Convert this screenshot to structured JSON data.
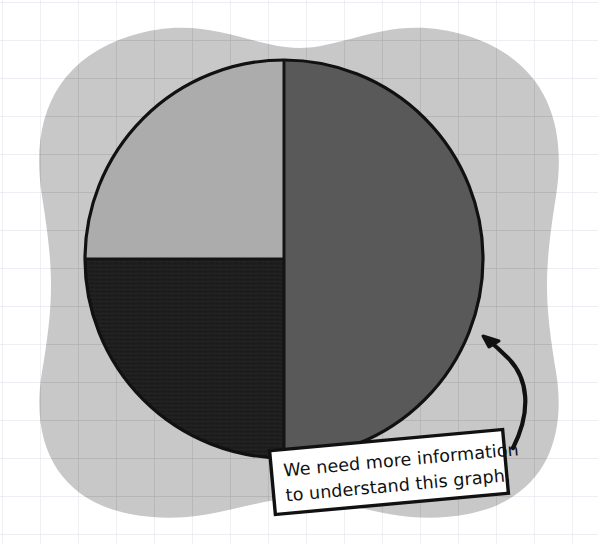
{
  "canvas": {
    "width": 598,
    "height": 544,
    "background_color": "#ffffff"
  },
  "background": {
    "name": "grid-paper",
    "grid_color": "#e7e7ef",
    "grid_spacing": 38,
    "blob_color": "#c8c8c8",
    "blob_grid_color": "#9a9a9a"
  },
  "chart_data": {
    "type": "pie",
    "title": "",
    "subtitle": "",
    "xlabel": "",
    "ylabel": "",
    "legend_position": "none",
    "grid": false,
    "labels": [
      "Right half",
      "Upper left quadrant",
      "Lower left quadrant"
    ],
    "values": [
      50,
      25,
      25
    ],
    "units": "percent",
    "total": 100,
    "start_angle_deg": 0,
    "direction": "clockwise",
    "center": {
      "x": 284,
      "y": 259
    },
    "radius": 199,
    "outline_color": "#111111",
    "outline_width": 3,
    "slices": [
      {
        "label": "Right half",
        "value": 50,
        "percent": "50%",
        "color": "#595959",
        "start_angle_deg": 0,
        "end_angle_deg": 180
      },
      {
        "label": "Lower left quadrant",
        "value": 25,
        "percent": "25%",
        "color": "#1e1e1e",
        "start_angle_deg": 180,
        "end_angle_deg": 270
      },
      {
        "label": "Upper left quadrant",
        "value": 25,
        "percent": "25%",
        "color": "#acacac",
        "start_angle_deg": 270,
        "end_angle_deg": 360
      }
    ],
    "annotations": [
      {
        "name": "callout",
        "line1": "We need more information",
        "line2": "to understand this graph.",
        "points_to": {
          "x": 483,
          "y": 337
        },
        "box_color": "#ffffff",
        "border_color": "#111111",
        "text_color": "#111111",
        "rotation_deg": -5.5
      }
    ]
  },
  "callout": {
    "line1": "We need more information",
    "line2": "to understand this graph.",
    "box_fill": "#ffffff",
    "box_stroke": "#111111",
    "text_color": "#111111"
  },
  "arrow": {
    "name": "curved-arrow",
    "color": "#111111",
    "stroke_width": 4,
    "tip": {
      "x": 483,
      "y": 337
    }
  }
}
